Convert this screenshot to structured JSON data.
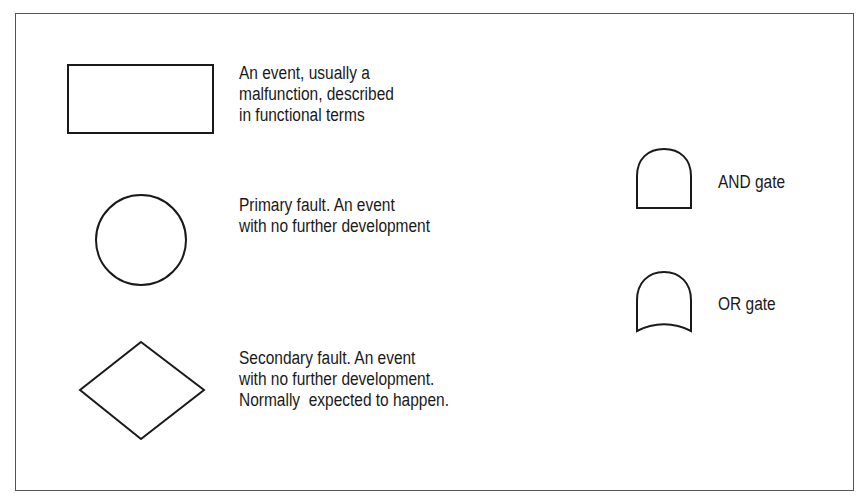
{
  "diagram": {
    "type": "fault-tree-legend",
    "stroke_color": "#1a1a1a",
    "background": "#ffffff",
    "items": [
      {
        "symbol": "rectangle",
        "lines": [
          "An event, usually a",
          "malfunction, described",
          "in functional terms"
        ]
      },
      {
        "symbol": "circle",
        "lines": [
          "Primary fault. An event",
          "with no further development"
        ]
      },
      {
        "symbol": "diamond",
        "lines": [
          "Secondary fault. An event",
          "with no further development.",
          "Normally  expected to happen."
        ]
      },
      {
        "symbol": "and-gate",
        "lines": [
          "AND gate"
        ]
      },
      {
        "symbol": "or-gate",
        "lines": [
          "OR gate"
        ]
      }
    ]
  }
}
